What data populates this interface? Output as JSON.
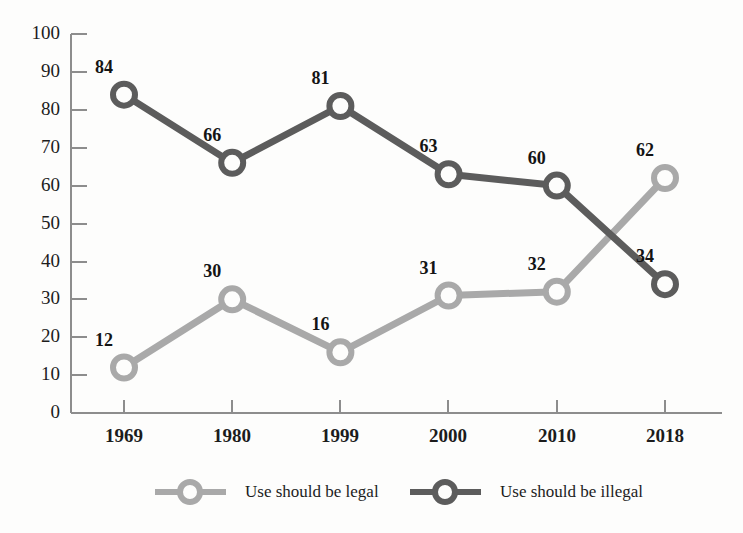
{
  "chart_data": {
    "type": "line",
    "title": "",
    "subtitle": "",
    "xlabel": "",
    "ylabel": "",
    "categories": [
      "1969",
      "1980",
      "1999",
      "2000",
      "2010",
      "2018"
    ],
    "ylim": [
      0,
      100
    ],
    "yticks": [
      "0",
      "10",
      "20",
      "30",
      "40",
      "50",
      "60",
      "70",
      "80",
      "90",
      "100"
    ],
    "grid": false,
    "legend_position": "bottom",
    "series": [
      {
        "name": "Use should be legal",
        "color": "#a9a9a9",
        "values": [
          12,
          30,
          16,
          31,
          32,
          62
        ],
        "labels": [
          "12",
          "30",
          "16",
          "31",
          "32",
          "62"
        ]
      },
      {
        "name": "Use should be illegal",
        "color": "#5c5c5c",
        "values": [
          84,
          66,
          81,
          63,
          60,
          34
        ],
        "labels": [
          "84",
          "66",
          "81",
          "63",
          "60",
          "34"
        ]
      }
    ]
  },
  "legend": {
    "items": [
      {
        "label": "Use should be legal",
        "color": "#a9a9a9"
      },
      {
        "label": "Use should be illegal",
        "color": "#5c5c5c"
      }
    ]
  },
  "axis": {
    "color": "#8d8d8d"
  }
}
